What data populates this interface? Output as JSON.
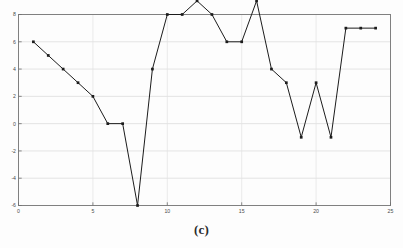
{
  "figure": {
    "caption": "(c)",
    "background_color": "#fdfdfd"
  },
  "chart_data": {
    "type": "line",
    "title": "",
    "xlabel": "",
    "ylabel": "",
    "xlim": [
      0,
      25
    ],
    "ylim": [
      -6,
      8
    ],
    "grid": true,
    "legend": null,
    "line_color": "#1c1c1c",
    "marker": "square",
    "marker_color": "#1c1c1c",
    "x_ticks": [
      0,
      5,
      10,
      15,
      20,
      25
    ],
    "x_tick_labels": [
      "0",
      "5",
      "10",
      "15",
      "20",
      "25"
    ],
    "y_ticks": [
      -6,
      -4,
      -2,
      0,
      2,
      4,
      6,
      8
    ],
    "y_tick_labels": [
      "-6",
      "-4",
      "-2",
      "0",
      "2",
      "4",
      "6",
      "8"
    ],
    "x": [
      1,
      2,
      3,
      4,
      5,
      6,
      7,
      8,
      9,
      10,
      11,
      12,
      13,
      14,
      15,
      16,
      17,
      18,
      19,
      20,
      21,
      22,
      23,
      24
    ],
    "values": [
      6,
      5,
      4,
      3,
      2,
      0,
      0,
      -6,
      4,
      8,
      8,
      9,
      8,
      6,
      6,
      9,
      4,
      3,
      -1,
      3,
      -1,
      7,
      7,
      7
    ],
    "series": [
      {
        "name": "series-1",
        "values": [
          6,
          5,
          4,
          3,
          2,
          0,
          0,
          -6,
          4,
          8,
          8,
          9,
          8,
          6,
          6,
          9,
          4,
          3,
          -1,
          3,
          -1,
          7,
          7,
          7
        ]
      }
    ]
  }
}
